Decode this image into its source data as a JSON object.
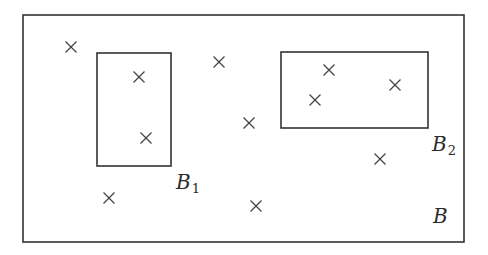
{
  "diagram": {
    "stroke_color": "#333333",
    "outer_box": {
      "name": "B",
      "label": "B",
      "x": 23,
      "y": 15,
      "w": 441,
      "h": 227
    },
    "sub_boxes": [
      {
        "name": "B1",
        "label": "B",
        "subscript": "1",
        "x": 97,
        "y": 53,
        "w": 74,
        "h": 113
      },
      {
        "name": "B2",
        "label": "B",
        "subscript": "2",
        "x": 281,
        "y": 52,
        "w": 147,
        "h": 76
      }
    ],
    "points": [
      {
        "x": 71,
        "y": 47
      },
      {
        "x": 139,
        "y": 77
      },
      {
        "x": 146,
        "y": 138
      },
      {
        "x": 219,
        "y": 62
      },
      {
        "x": 249,
        "y": 123
      },
      {
        "x": 329,
        "y": 70
      },
      {
        "x": 315,
        "y": 100
      },
      {
        "x": 395,
        "y": 85
      },
      {
        "x": 380,
        "y": 159
      },
      {
        "x": 109,
        "y": 198
      },
      {
        "x": 256,
        "y": 206
      }
    ],
    "point_marker": "×"
  }
}
